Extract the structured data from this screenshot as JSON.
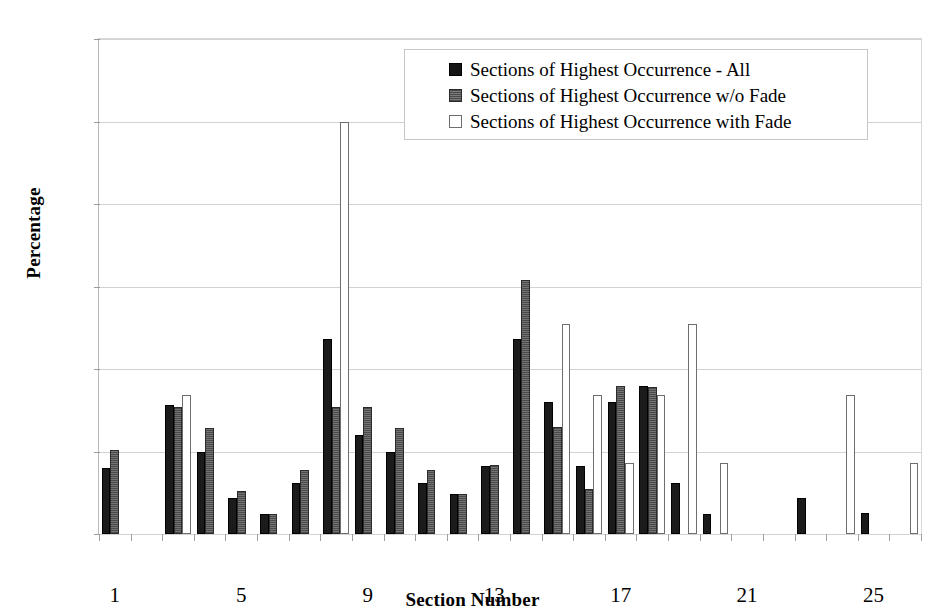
{
  "chart_data": {
    "type": "bar",
    "title": "",
    "xlabel": "Section Number",
    "ylabel": "Percentage",
    "ylim": [
      0,
      30
    ],
    "ytick_values": [
      0,
      5,
      10,
      15,
      20,
      25,
      30
    ],
    "ytick_labels": [
      "0",
      "5",
      "10",
      "15",
      "20",
      "25",
      "30"
    ],
    "xlim": [
      0.5,
      26.5
    ],
    "xtick_values": [
      1,
      5,
      9,
      13,
      17,
      21,
      25
    ],
    "xtick_labels": [
      "1",
      "5",
      "9",
      "13",
      "17",
      "21",
      "25"
    ],
    "grid": "horizontal",
    "legend_position": "top-right",
    "categories": [
      1,
      2,
      3,
      4,
      5,
      6,
      7,
      8,
      9,
      10,
      11,
      12,
      13,
      14,
      15,
      16,
      17,
      18,
      19,
      20,
      21,
      22,
      23,
      24,
      25,
      26
    ],
    "series": [
      {
        "name": "Sections of Highest Occurrence -  All",
        "swatch": "s-all",
        "color": "#1b1b1b",
        "values": [
          4.0,
          0,
          7.8,
          5.0,
          2.2,
          1.2,
          3.1,
          11.8,
          6.0,
          5.0,
          3.1,
          2.4,
          4.1,
          11.8,
          8.0,
          4.1,
          8.0,
          9.0,
          3.1,
          1.2,
          0,
          0,
          2.2,
          0,
          1.3,
          0
        ]
      },
      {
        "name": "Sections of Highest Occurrence w/o Fade",
        "swatch": "s-wofade",
        "color": "#595959",
        "values": [
          5.1,
          0,
          7.7,
          6.4,
          2.6,
          1.2,
          3.9,
          7.7,
          7.7,
          6.4,
          3.9,
          2.4,
          4.2,
          15.4,
          6.5,
          2.7,
          9.0,
          8.9,
          0,
          0,
          0,
          0,
          0,
          0,
          0,
          0
        ]
      },
      {
        "name": "Sections of Highest Occurrence with Fade",
        "swatch": "s-withfade",
        "color": "#ffffff",
        "values": [
          0,
          0,
          8.4,
          0,
          0,
          0,
          0,
          25.0,
          0,
          0,
          0,
          0,
          0,
          0,
          12.7,
          8.4,
          4.3,
          8.4,
          12.7,
          4.3,
          0,
          0,
          0,
          8.4,
          0,
          4.3
        ]
      }
    ]
  }
}
